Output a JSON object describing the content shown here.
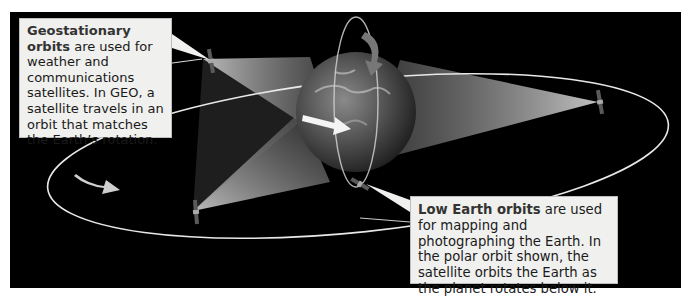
{
  "diagram": {
    "type": "satellite-orbits-illustration",
    "background_color": "#000000",
    "callouts": {
      "geo": {
        "title": "Geostationary orbits",
        "text": " are used for weather and communications satellites. In GEO, a satellite travels in an orbit that matches the Earth’s rotation."
      },
      "leo": {
        "title": "Low Earth orbits",
        "text": " are used for mapping and photographing the Earth. In the polar orbit shown, the satellite orbits the Earth as the planet rotates below it."
      }
    },
    "elements": [
      {
        "id": "earth",
        "label": "Earth globe"
      },
      {
        "id": "geo-orbit",
        "label": "Geostationary orbit ellipse"
      },
      {
        "id": "polar-orbit",
        "label": "Polar low Earth orbit"
      },
      {
        "id": "geo-satellites",
        "count": 3
      },
      {
        "id": "leo-satellite",
        "count": 1
      },
      {
        "id": "rotation-arrows",
        "count": 3
      }
    ]
  }
}
